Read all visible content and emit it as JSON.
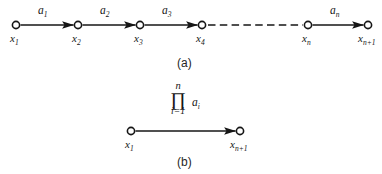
{
  "figure": {
    "background_color": "#ffffff",
    "ink_color": "#161616",
    "panel_a": {
      "caption": "(a)",
      "nodes": [
        {
          "id": "x1",
          "label_base": "x",
          "label_sub": "1",
          "cx": 16,
          "cy": 25
        },
        {
          "id": "x2",
          "label_base": "x",
          "label_sub": "2",
          "cx": 78,
          "cy": 25
        },
        {
          "id": "x3",
          "label_base": "x",
          "label_sub": "3",
          "cx": 140,
          "cy": 25
        },
        {
          "id": "x4",
          "label_base": "x",
          "label_sub": "4",
          "cx": 202,
          "cy": 25
        },
        {
          "id": "xn",
          "label_base": "x",
          "label_sub": "n",
          "cx": 308,
          "cy": 25
        },
        {
          "id": "xn1",
          "label_base": "x",
          "label_sub": "n+1",
          "cx": 368,
          "cy": 25
        }
      ],
      "edges": [
        {
          "from": "x1",
          "to": "x2",
          "weight_base": "a",
          "weight_sub": "1",
          "style": "solid-arrow"
        },
        {
          "from": "x2",
          "to": "x3",
          "weight_base": "a",
          "weight_sub": "2",
          "style": "solid-arrow"
        },
        {
          "from": "x3",
          "to": "x4",
          "weight_base": "a",
          "weight_sub": "3",
          "style": "solid-arrow"
        },
        {
          "from": "x4",
          "to": "xn",
          "weight_base": "",
          "weight_sub": "",
          "style": "dashed"
        },
        {
          "from": "xn",
          "to": "xn1",
          "weight_base": "a",
          "weight_sub": "n",
          "style": "solid-arrow"
        }
      ]
    },
    "panel_b": {
      "caption": "(b)",
      "nodes": [
        {
          "id": "x1",
          "label_base": "x",
          "label_sub": "1",
          "cx": 131,
          "cy": 131
        },
        {
          "id": "xn1",
          "label_base": "x",
          "label_sub": "n+1",
          "cx": 240,
          "cy": 131
        }
      ],
      "edges": [
        {
          "from": "x1",
          "to": "xn1",
          "style": "solid-arrow"
        }
      ],
      "product_notation": {
        "upper_limit": "n",
        "symbol": "∏",
        "lower_limit": "i=1",
        "operand_base": "a",
        "operand_sub": "i"
      }
    }
  }
}
